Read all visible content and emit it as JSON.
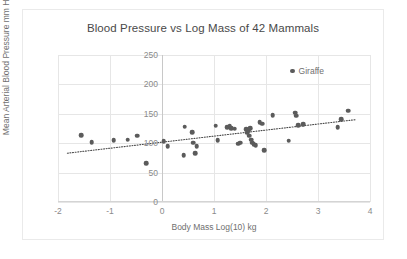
{
  "chart_data": {
    "type": "scatter",
    "title": "Blood Pressure vs Log Mass of 42 Mammals",
    "xlabel": "Body Mass Log(10) kg",
    "ylabel": "Mean Arterial Blood Pressure mm Hg",
    "xlim": [
      -2,
      4
    ],
    "ylim": [
      0,
      250
    ],
    "xticks": [
      -2,
      -1,
      0,
      1,
      2,
      3,
      4
    ],
    "xticklabels": [
      "-2",
      "-1",
      "0",
      "1",
      "2",
      "3",
      "4"
    ],
    "yticks": [
      0,
      50,
      100,
      150,
      200,
      250
    ],
    "yticklabels": [
      "0",
      "50",
      "100",
      "150",
      "200",
      "250"
    ],
    "grid": true,
    "legend_position": "inside-top-right",
    "legend": [
      {
        "label": "Giraffe",
        "color": "#5b5b5b",
        "marker": "circle"
      }
    ],
    "marker_color": "#5b5b5b",
    "trendline": {
      "type": "linear",
      "style": "dotted",
      "color": "#4a4a4a",
      "x0": -1.82,
      "y0": 83,
      "x1": 3.72,
      "y1": 140
    },
    "points": [
      {
        "x": -1.55,
        "y": 114
      },
      {
        "x": -1.35,
        "y": 102
      },
      {
        "x": -0.93,
        "y": 105
      },
      {
        "x": -0.66,
        "y": 106
      },
      {
        "x": -0.48,
        "y": 113
      },
      {
        "x": -0.3,
        "y": 66
      },
      {
        "x": 0.03,
        "y": 103
      },
      {
        "x": 0.11,
        "y": 95
      },
      {
        "x": 0.42,
        "y": 80
      },
      {
        "x": 0.44,
        "y": 128
      },
      {
        "x": 0.58,
        "y": 119
      },
      {
        "x": 0.6,
        "y": 101
      },
      {
        "x": 0.64,
        "y": 83
      },
      {
        "x": 0.67,
        "y": 95
      },
      {
        "x": 1.03,
        "y": 130
      },
      {
        "x": 1.07,
        "y": 105
      },
      {
        "x": 1.25,
        "y": 127
      },
      {
        "x": 1.3,
        "y": 130
      },
      {
        "x": 1.33,
        "y": 126
      },
      {
        "x": 1.4,
        "y": 125
      },
      {
        "x": 1.47,
        "y": 99
      },
      {
        "x": 1.5,
        "y": 101
      },
      {
        "x": 1.62,
        "y": 124
      },
      {
        "x": 1.64,
        "y": 118
      },
      {
        "x": 1.66,
        "y": 122
      },
      {
        "x": 1.68,
        "y": 113
      },
      {
        "x": 1.7,
        "y": 126
      },
      {
        "x": 1.71,
        "y": 106
      },
      {
        "x": 1.73,
        "y": 101
      },
      {
        "x": 1.76,
        "y": 98
      },
      {
        "x": 1.8,
        "y": 97
      },
      {
        "x": 1.88,
        "y": 136
      },
      {
        "x": 1.93,
        "y": 133
      },
      {
        "x": 1.97,
        "y": 88
      },
      {
        "x": 2.13,
        "y": 148
      },
      {
        "x": 2.44,
        "y": 104
      },
      {
        "x": 2.56,
        "y": 152
      },
      {
        "x": 2.58,
        "y": 147
      },
      {
        "x": 2.62,
        "y": 131
      },
      {
        "x": 2.72,
        "y": 132
      },
      {
        "x": 3.38,
        "y": 127
      },
      {
        "x": 3.45,
        "y": 141
      },
      {
        "x": 3.58,
        "y": 155
      }
    ]
  }
}
